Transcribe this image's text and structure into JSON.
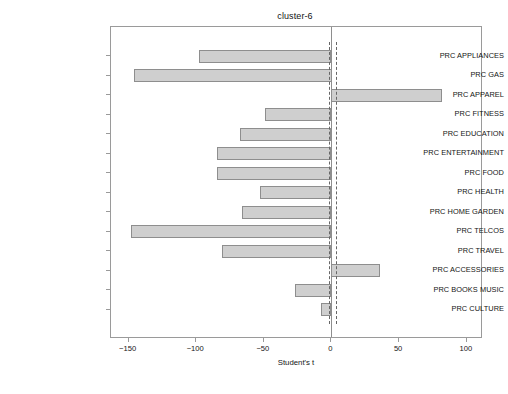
{
  "chart_data": {
    "type": "bar",
    "orientation": "horizontal",
    "title": "cluster-6",
    "xlabel": "Student's t",
    "ylabel": "",
    "xlim": [
      -163,
      112
    ],
    "xticks": [
      -150,
      -100,
      -50,
      0,
      50,
      100
    ],
    "xticklabels": [
      "−150",
      "−100",
      "−50",
      "0",
      "50",
      "100"
    ],
    "grid": false,
    "legend": null,
    "categories": [
      "PRC APPLIANCES",
      "PRC GAS",
      "PRC APPAREL",
      "PRC FITNESS",
      "PRC EDUCATION",
      "PRC ENTERTAINMENT",
      "PRC FOOD",
      "PRC HEALTH",
      "PRC HOME GARDEN",
      "PRC TELCOS",
      "PRC TRAVEL",
      "PRC ACCESSORIES",
      "PRC BOOKS MUSIC",
      "PRC CULTURE"
    ],
    "values": [
      -98,
      -146,
      82,
      -49,
      -68,
      -85,
      -85,
      -53,
      -66,
      -148,
      -81,
      36,
      -27,
      -8
    ],
    "reference_lines": [
      {
        "name": "zero-line",
        "value": 0,
        "style": "solid"
      },
      {
        "name": "significance-threshold-negative",
        "value": -2,
        "style": "dashed"
      },
      {
        "name": "significance-threshold-positive",
        "value": 3,
        "style": "dashed"
      }
    ],
    "colors": {
      "bar_fill": "#cfcfcf",
      "bar_edge": "#8e8e8e",
      "frame": "#9a9a9a",
      "text": "#141414",
      "background": "#ffffff"
    }
  }
}
